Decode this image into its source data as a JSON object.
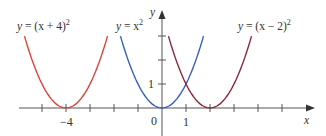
{
  "chart_data": {
    "type": "line",
    "title": "",
    "xlabel": "x",
    "ylabel": "y",
    "x_tick_labels": [
      "-4",
      "0",
      "1"
    ],
    "y_tick_labels": [
      "1"
    ],
    "xlim": [
      -5.9,
      6.3
    ],
    "ylim": [
      0,
      3.6
    ],
    "grid": false,
    "legend": "inline labels",
    "series": [
      {
        "name": "y = (x + 4)^2",
        "label": "y = (x + 4)²",
        "color": "#d9453a",
        "vertex": [
          -4,
          0
        ],
        "x_range": [
          -5.73,
          -2.27
        ]
      },
      {
        "name": "y = x^2",
        "label": "y = x²",
        "color": "#3a5fbf",
        "vertex": [
          0,
          0
        ],
        "x_range": [
          -1.73,
          1.73
        ]
      },
      {
        "name": "y = (x - 2)^2",
        "label": "y = (x − 2)²",
        "color": "#8b2a3a",
        "vertex": [
          2,
          0
        ],
        "x_range": [
          0.27,
          3.73
        ]
      }
    ]
  },
  "labels": {
    "red": {
      "lhs": "y",
      "rhs": " = (x + 4)",
      "exp": "2"
    },
    "blue": {
      "lhs": "y",
      "rhs": " = x",
      "exp": "2"
    },
    "maroon": {
      "lhs": "y",
      "rhs": " = (x − 2)",
      "exp": "2"
    },
    "x_axis": "x",
    "y_axis": "y",
    "tick_neg4": "−4",
    "tick_0": "0",
    "tick_1": "1",
    "tick_y1": "1"
  },
  "colors": {
    "red": "#d9453a",
    "blue": "#3a5fbf",
    "maroon": "#8b2a3a",
    "axis": "#555555"
  }
}
